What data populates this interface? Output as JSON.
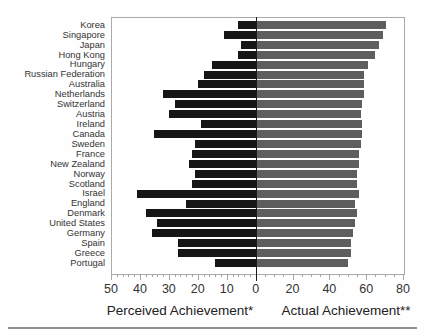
{
  "chart_data": {
    "type": "bar",
    "subtype": "diverging-horizontal",
    "title": "",
    "categories": [
      "Korea",
      "Singapore",
      "Japan",
      "Hong Kong",
      "Hungary",
      "Russian Federation",
      "Australia",
      "Netherlands",
      "Switzerland",
      "Austria",
      "Ireland",
      "Canada",
      "Sweden",
      "France",
      "New Zealand",
      "Norway",
      "Scotland",
      "Israel",
      "England",
      "Denmark",
      "United States",
      "Germany",
      "Spain",
      "Greece",
      "Portugal"
    ],
    "series": [
      {
        "name": "Perceived Achievement*",
        "direction": "left",
        "color": "#161616",
        "values": [
          6,
          11,
          5,
          6,
          15,
          18,
          20,
          32,
          28,
          30,
          19,
          35,
          21,
          22,
          23,
          21,
          22,
          41,
          24,
          38,
          34,
          36,
          27,
          27,
          14
        ]
      },
      {
        "name": "Actual Achievement**",
        "direction": "right",
        "color": "#5e5e5e",
        "values": [
          71,
          69,
          67,
          65,
          61,
          59,
          59,
          59,
          58,
          57,
          58,
          58,
          57,
          56,
          56,
          55,
          55,
          56,
          54,
          55,
          54,
          53,
          52,
          52,
          50
        ]
      }
    ],
    "xlabel_left": "Perceived Achievement*",
    "xlabel_right": "Actual Achievement**",
    "left_axis": {
      "min": 0,
      "max": 50,
      "major_step": 10,
      "minor_step": 2,
      "tick_labels": [
        50,
        40,
        30,
        20,
        10,
        0
      ]
    },
    "right_axis": {
      "min": 0,
      "max": 80,
      "major_step": 20,
      "minor_step": 5,
      "tick_labels": [
        20,
        40,
        60,
        80
      ]
    },
    "grid": false,
    "legend_position": "none"
  },
  "colors": {
    "perceived_bar": "#161616",
    "actual_bar": "#5e5e5e",
    "frame": "#aaaaaa",
    "zero_line": "#1a1a1a",
    "text": "#333333",
    "bottom_rule": "#8f8f8f",
    "background": "#ffffff"
  }
}
